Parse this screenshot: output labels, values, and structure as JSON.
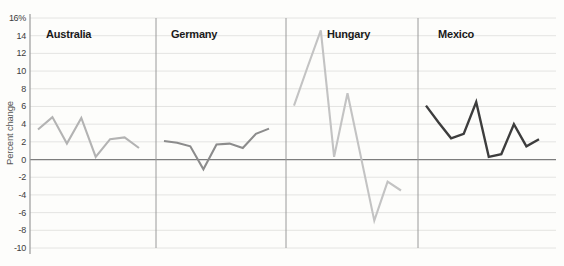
{
  "chart_data": {
    "type": "line",
    "title": "",
    "ylabel": "Percent change",
    "ylim": [
      -10,
      16
    ],
    "ytick_step": 2,
    "ytick_labels": [
      "16%",
      "14",
      "12",
      "10",
      "8",
      "6",
      "4",
      "2",
      "0",
      "-2",
      "-4",
      "-6",
      "-8",
      "-10"
    ],
    "grid": "horizontal",
    "zero_line": true,
    "legend_position": "none",
    "panels": [
      {
        "label": "Australia",
        "color": "#b3b3b3",
        "values": [
          3.4,
          4.8,
          1.8,
          4.7,
          0.3,
          2.3,
          2.5,
          1.3
        ]
      },
      {
        "label": "Germany",
        "color": "#8c8c8c",
        "values": [
          2.1,
          1.9,
          1.5,
          -1.1,
          1.7,
          1.8,
          1.3,
          2.9,
          3.5
        ]
      },
      {
        "label": "Hungary",
        "color": "#c3c3c3",
        "values": [
          6.1,
          10.4,
          14.6,
          0.3,
          7.5,
          0.3,
          -6.9,
          -2.5,
          -3.5
        ]
      },
      {
        "label": "Mexico",
        "color": "#3d3d3d",
        "values": [
          6.1,
          4.2,
          2.4,
          2.9,
          6.5,
          0.3,
          0.6,
          4.0,
          1.5,
          2.3
        ]
      }
    ],
    "colors": {
      "gridline": "#e4e4e2",
      "zero_line": "#7d7d7d",
      "axis_line": "#9a9a9a",
      "divider_line": "#9a9a9a",
      "tick_text": "#3c3c3c",
      "label_text": "#1a1a1a"
    },
    "layout_hints": {
      "plot_left": 30,
      "plot_right": 556,
      "plot_top": 18,
      "plot_bottom": 248,
      "panel_bounds": [
        30,
        156,
        286,
        418,
        556
      ],
      "series_inset_left": 8,
      "series_inset_right": 17,
      "panel_label_offsets": [
        16,
        15,
        41,
        20
      ],
      "panel_label_top": 28
    }
  }
}
